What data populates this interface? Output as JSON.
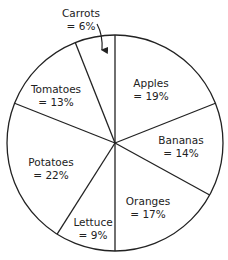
{
  "chart_data": {
    "type": "pie",
    "title": "",
    "start_angle_deg": 0,
    "direction": "clockwise",
    "center": [
      115,
      143
    ],
    "radius": 108,
    "slices": [
      {
        "label": "Apples",
        "value": 19,
        "value_text": "= 19%",
        "label_pos": [
          151,
          83
        ]
      },
      {
        "label": "Bananas",
        "value": 14,
        "value_text": "= 14%",
        "label_pos": [
          181,
          140
        ]
      },
      {
        "label": "Oranges",
        "value": 17,
        "value_text": "= 17%",
        "label_pos": [
          148,
          201
        ]
      },
      {
        "label": "Lettuce",
        "value": 9,
        "value_text": "= 9%",
        "label_pos": [
          93,
          222
        ]
      },
      {
        "label": "Potatoes",
        "value": 22,
        "value_text": "= 22%",
        "label_pos": [
          51,
          162
        ]
      },
      {
        "label": "Tomatoes",
        "value": 13,
        "value_text": "= 13%",
        "label_pos": [
          56,
          89
        ]
      },
      {
        "label": "Carrots",
        "value": 6,
        "value_text": "= 6%",
        "label_pos": [
          81,
          13
        ],
        "external_label": true,
        "arrow": true
      }
    ],
    "categories": [
      "Apples",
      "Bananas",
      "Oranges",
      "Lettuce",
      "Potatoes",
      "Tomatoes",
      "Carrots"
    ],
    "values": [
      19,
      14,
      17,
      9,
      22,
      13,
      6
    ],
    "units": "%",
    "fill_color": "#ffffff",
    "stroke_color": "#222222",
    "legend": "none"
  }
}
